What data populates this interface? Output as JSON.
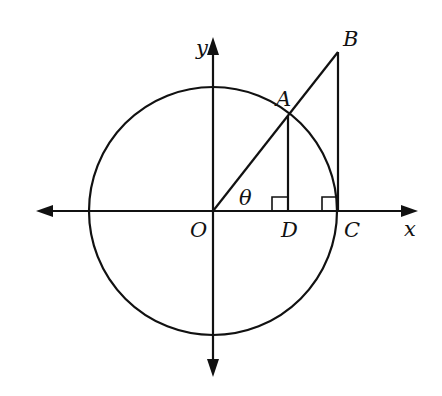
{
  "diagram": {
    "type": "unit circle trigonometry (tangent line)",
    "colors": {
      "stroke": "#111111",
      "background": "#ffffff"
    },
    "labels": {
      "y_axis": "y",
      "x_axis": "x",
      "origin": "O",
      "point_a": "A",
      "point_b": "B",
      "point_c": "C",
      "point_d": "D",
      "angle": "θ"
    },
    "elements": [
      "circle centered at O",
      "x-axis with arrows both directions",
      "y-axis with arrows both directions",
      "segment OB through A on circle",
      "perpendicular AD to x-axis with right angle mark at D",
      "perpendicular BC to x-axis at C (on circle) with right angle mark"
    ]
  }
}
